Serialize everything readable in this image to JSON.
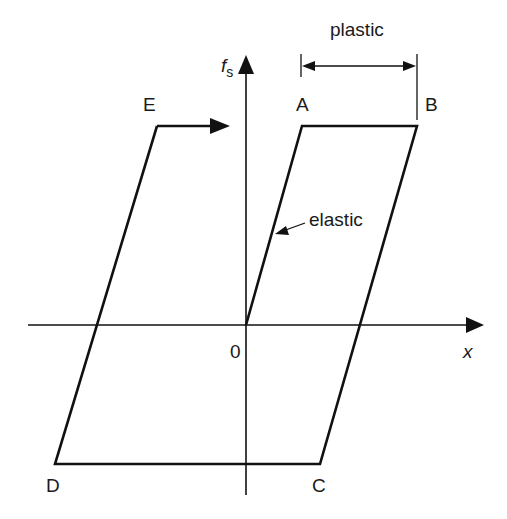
{
  "diagram": {
    "type": "hysteresis-loop",
    "axes": {
      "y_label": "f",
      "y_label_subscript": "s",
      "x_label": "x",
      "origin_label": "0"
    },
    "points": {
      "A": "A",
      "B": "B",
      "C": "C",
      "D": "D",
      "E": "E"
    },
    "annotations": {
      "plastic": "plastic",
      "elastic": "elastic"
    },
    "path_order": [
      "0",
      "A",
      "B",
      "C",
      "D",
      "E"
    ],
    "colors": {
      "line": "#111111",
      "background": "#ffffff"
    }
  }
}
